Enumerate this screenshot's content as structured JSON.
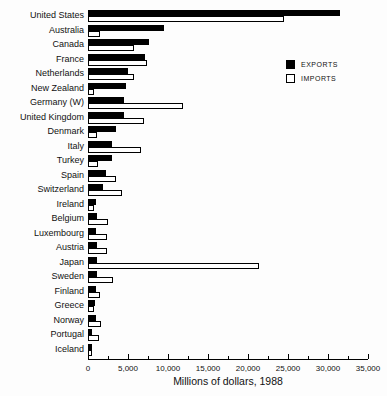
{
  "chart_data": {
    "type": "bar",
    "orientation": "horizontal",
    "title": "",
    "xlabel": "Millions of dollars, 1988",
    "xlim": [
      0,
      35000
    ],
    "x_ticks": [
      0,
      5000,
      10000,
      15000,
      20000,
      25000,
      30000,
      35000
    ],
    "x_tick_labels": [
      "0",
      "5,000",
      "10,000",
      "15,000",
      "20,000",
      "25,000",
      "30,000",
      "35,000"
    ],
    "minor_tick_interval": 2500,
    "grid": false,
    "legend_position": "upper-right",
    "bar_fill_exports": "#000000",
    "bar_fill_imports": "#ffffff",
    "categories": [
      "United States",
      "Australia",
      "Canada",
      "France",
      "Netherlands",
      "New Zealand",
      "Germany (W)",
      "United Kingdom",
      "Denmark",
      "Italy",
      "Turkey",
      "Spain",
      "Switzerland",
      "Ireland",
      "Belgium",
      "Luxembourg",
      "Austria",
      "Japan",
      "Sweden",
      "Finland",
      "Greece",
      "Norway",
      "Portugal",
      "Iceland"
    ],
    "series": [
      {
        "name": "EXPORTS",
        "values": [
          31200,
          9300,
          7400,
          6900,
          4700,
          4500,
          4300,
          4200,
          3300,
          2700,
          2700,
          1950,
          1600,
          700,
          900,
          700,
          900,
          900,
          900,
          750,
          600,
          700,
          300,
          100
        ]
      },
      {
        "name": "IMPORTS",
        "values": [
          24200,
          1200,
          5500,
          7100,
          5500,
          550,
          11600,
          6800,
          900,
          6400,
          1000,
          3200,
          4000,
          450,
          2200,
          2100,
          2100,
          21100,
          2900,
          1200,
          500,
          1400,
          1100,
          150
        ]
      }
    ]
  },
  "legend": {
    "exports_label": "EXPORTS",
    "imports_label": "IMPORTS"
  }
}
